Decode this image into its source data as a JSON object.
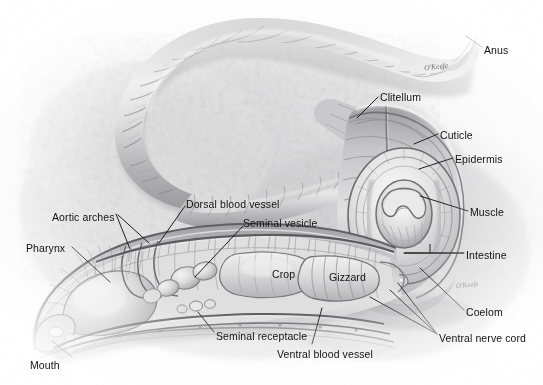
{
  "figure": {
    "medium": "graphite pencil illustration, grayscale",
    "artist_signature": "O'Keefe",
    "artist_signature_secondary": "O'Keefe"
  },
  "labels": [
    {
      "id": "anus",
      "text": "Anus",
      "x": 484,
      "y": 45,
      "anchor": "left"
    },
    {
      "id": "clitellum",
      "text": "Clitellum",
      "x": 380,
      "y": 92,
      "anchor": "left"
    },
    {
      "id": "cuticle",
      "text": "Cuticle",
      "x": 440,
      "y": 130,
      "anchor": "left"
    },
    {
      "id": "epidermis",
      "text": "Epidermis",
      "x": 455,
      "y": 154,
      "anchor": "left"
    },
    {
      "id": "muscle",
      "text": "Muscle",
      "x": 470,
      "y": 207,
      "anchor": "left"
    },
    {
      "id": "intestine",
      "text": "Intestine",
      "x": 466,
      "y": 250,
      "anchor": "left"
    },
    {
      "id": "coelom",
      "text": "Coelom",
      "x": 466,
      "y": 307,
      "anchor": "left"
    },
    {
      "id": "ventral-nerve-cord",
      "text": "Ventral nerve cord",
      "x": 439,
      "y": 333,
      "anchor": "left"
    },
    {
      "id": "ventral-blood-vessel",
      "text": "Ventral blood vessel",
      "x": 277,
      "y": 349,
      "anchor": "left"
    },
    {
      "id": "seminal-receptacle",
      "text": "Seminal receptacle",
      "x": 216,
      "y": 331,
      "anchor": "left"
    },
    {
      "id": "mouth",
      "text": "Mouth",
      "x": 30,
      "y": 360,
      "anchor": "left"
    },
    {
      "id": "pharynx",
      "text": "Pharynx",
      "x": 26,
      "y": 243,
      "anchor": "left"
    },
    {
      "id": "aortic-arches",
      "text": "Aortic arches",
      "x": 52,
      "y": 212,
      "anchor": "left"
    },
    {
      "id": "dorsal-blood-vessel",
      "text": "Dorsal blood vessel",
      "x": 186,
      "y": 199,
      "anchor": "left"
    },
    {
      "id": "seminal-vesicle",
      "text": "Seminal vesicle",
      "x": 243,
      "y": 218,
      "anchor": "left"
    },
    {
      "id": "crop",
      "text": "Crop",
      "x": 272,
      "y": 269,
      "anchor": "left"
    },
    {
      "id": "gizzard",
      "text": "Gizzard",
      "x": 329,
      "y": 272,
      "anchor": "left"
    }
  ],
  "leader_lines": [
    {
      "id": "leader-anus",
      "from": [
        482,
        47
      ],
      "to": [
        466,
        36
      ]
    },
    {
      "id": "leader-clitellum",
      "from": [
        378,
        97
      ],
      "to": [
        357,
        118
      ]
    },
    {
      "id": "leader-cuticle",
      "from": [
        438,
        134
      ],
      "to": [
        414,
        144
      ]
    },
    {
      "id": "leader-epidermis",
      "from": [
        453,
        158
      ],
      "to": [
        419,
        169
      ]
    },
    {
      "id": "leader-muscle",
      "from": [
        468,
        211
      ],
      "to": [
        420,
        196
      ]
    },
    {
      "id": "leader-intestine",
      "from": [
        464,
        253
      ],
      "to": [
        404,
        253
      ]
    },
    {
      "id": "leader-coelom",
      "from": [
        464,
        310
      ],
      "to": [
        420,
        268
      ]
    },
    {
      "id": "leader-vnc-a",
      "from": [
        437,
        334
      ],
      "to": [
        398,
        283
      ]
    },
    {
      "id": "leader-vnc-b",
      "from": [
        437,
        334
      ],
      "to": [
        390,
        290
      ]
    },
    {
      "id": "leader-vnc-c",
      "from": [
        437,
        334
      ],
      "to": [
        370,
        297
      ]
    },
    {
      "id": "leader-ventral-blood-vessel",
      "from": [
        312,
        344
      ],
      "to": [
        322,
        308
      ]
    },
    {
      "id": "leader-seminal-receptacle",
      "from": [
        214,
        332
      ],
      "to": [
        198,
        312
      ]
    },
    {
      "id": "leader-mouth",
      "from": [
        72,
        357
      ],
      "to": [
        52,
        341
      ]
    },
    {
      "id": "leader-pharynx",
      "from": [
        72,
        247
      ],
      "to": [
        110,
        282
      ]
    },
    {
      "id": "leader-aortic-a",
      "from": [
        116,
        214
      ],
      "to": [
        130,
        249
      ]
    },
    {
      "id": "leader-aortic-b",
      "from": [
        118,
        215
      ],
      "to": [
        149,
        243
      ]
    },
    {
      "id": "leader-dorsal-blood-vessel",
      "from": [
        185,
        206
      ],
      "to": [
        159,
        243
      ]
    },
    {
      "id": "leader-seminal-vesicle",
      "from": [
        243,
        226
      ],
      "to": [
        195,
        277
      ]
    }
  ],
  "signature": {
    "text": "O'Keefe",
    "x": 424,
    "y": 62
  },
  "signature2": {
    "text": "O'Keefe",
    "x": 456,
    "y": 281
  }
}
